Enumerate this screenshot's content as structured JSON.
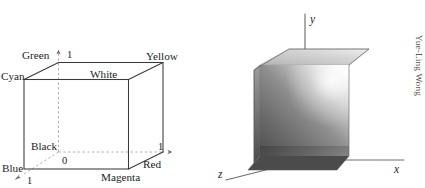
{
  "figures": {
    "left": {
      "name": "rgb-color-cube-wireframe",
      "vertex_labels": {
        "green": "Green",
        "cyan": "Cyan",
        "yellow": "Yellow",
        "white": "White",
        "black": "Black",
        "blue": "Blue",
        "red": "Red",
        "magenta": "Magenta"
      },
      "axis_values": {
        "origin": "0",
        "green_axis_one": "1",
        "red_axis_one": "1",
        "blue_axis_one": "1"
      },
      "line_color": "#3a3a3a",
      "dashed_color": "#9a9a9a",
      "text_color": "#1d1d1d"
    },
    "right": {
      "name": "shaded-grayscale-cube",
      "axis_labels": {
        "x": "x",
        "y": "y",
        "z": "z"
      },
      "axis_color": "#6e6e6e",
      "cube_colors": {
        "front_dark": "#5b5b5b",
        "front_mid": "#8f8f8f",
        "front_light": "#f2f2f2",
        "top_light": "#cfcfcf",
        "top_shadow": "#a9a9a9",
        "side_dark": "#4f4f4f",
        "highlight": "#fdfdfd"
      }
    }
  },
  "credit": {
    "text": "Yue-Ling Wong"
  }
}
